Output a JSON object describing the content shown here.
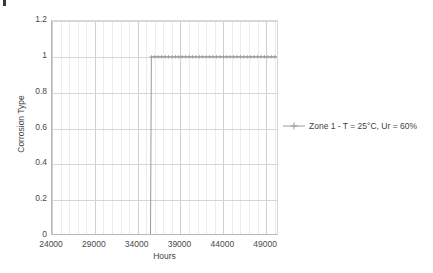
{
  "chart_data": {
    "type": "line",
    "title": "",
    "subtitle": "",
    "xlabel": "Hours",
    "ylabel": "Corrosion Type",
    "xlim": [
      24000,
      50500
    ],
    "ylim": [
      0,
      1.2
    ],
    "grid": true,
    "legend_position": "right",
    "xticks": [
      "24000",
      "29000",
      "34000",
      "39000",
      "44000",
      "49000"
    ],
    "xtick_values": [
      24000,
      29000,
      34000,
      39000,
      44000,
      49000
    ],
    "yticks": [
      "0",
      "0.2",
      "0.4",
      "0.6",
      "0.8",
      "1",
      "1.2"
    ],
    "ytick_values": [
      0,
      0.2,
      0.4,
      0.6,
      0.8,
      1,
      1.2
    ],
    "minor_x_step": 1000,
    "series": [
      {
        "name": "Zone 1 - T = 25°C, Ur = 60%",
        "color": "#9a9a9a",
        "marker": "plus",
        "x": [
          24800,
          25200,
          25600,
          26000,
          26400,
          26800,
          27200,
          27600,
          28000,
          28400,
          28800,
          29200,
          29600,
          30000,
          30400,
          30800,
          31200,
          31600,
          32000,
          32400,
          32800,
          33200,
          33600,
          34000,
          34400,
          34800,
          35200,
          35500,
          35600,
          36000,
          36400,
          36800,
          37200,
          37600,
          38000,
          38400,
          38800,
          39200,
          39600,
          40000,
          40400,
          40800,
          41200,
          41600,
          42000,
          42400,
          42800,
          43200,
          43600,
          44000,
          44400,
          44800,
          45200,
          45600,
          46000,
          46400,
          46800,
          47200,
          47600,
          48000,
          48400,
          48800,
          49200,
          49600,
          50000,
          50400
        ],
        "y": [
          0,
          0,
          0,
          0,
          0,
          0,
          0,
          0,
          0,
          0,
          0,
          0,
          0,
          0,
          0,
          0,
          0,
          0,
          0,
          0,
          0,
          0,
          0,
          0,
          0,
          0,
          0,
          0,
          1,
          1,
          1,
          1,
          1,
          1,
          1,
          1,
          1,
          1,
          1,
          1,
          1,
          1,
          1,
          1,
          1,
          1,
          1,
          1,
          1,
          1,
          1,
          1,
          1,
          1,
          1,
          1,
          1,
          1,
          1,
          1,
          1,
          1,
          1,
          1,
          1,
          1
        ],
        "step_at": 35500,
        "low_value": 0,
        "high_value": 1
      }
    ]
  },
  "legend": {
    "entries": [
      {
        "label": "Zone 1 - T = 25°C, Ur = 60%",
        "marker": "line-plus"
      }
    ]
  },
  "axes": {
    "x_title": "Hours",
    "y_title": "Corrosion Type"
  }
}
